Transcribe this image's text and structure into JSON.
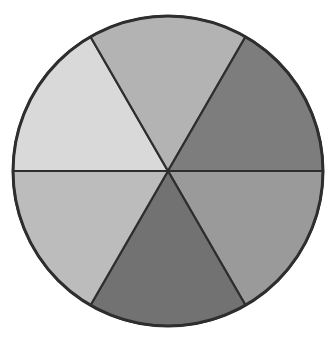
{
  "diagram": {
    "type": "segmented-circle",
    "segments_count": 6,
    "center": [
      168,
      171
    ],
    "radius": 155,
    "outline_color": "#2e2e2e",
    "segments": [
      {
        "name": "segment-upper-left",
        "start_deg": 180,
        "end_deg": 240,
        "color": "#d9d9d9"
      },
      {
        "name": "segment-top",
        "start_deg": 240,
        "end_deg": 300,
        "color": "#b3b3b3"
      },
      {
        "name": "segment-upper-right",
        "start_deg": 300,
        "end_deg": 360,
        "color": "#7d7d7d"
      },
      {
        "name": "segment-lower-right",
        "start_deg": 0,
        "end_deg": 60,
        "color": "#9a9a9a"
      },
      {
        "name": "segment-bottom",
        "start_deg": 60,
        "end_deg": 120,
        "color": "#727272"
      },
      {
        "name": "segment-lower-left",
        "start_deg": 120,
        "end_deg": 180,
        "color": "#bcbcbc"
      }
    ]
  }
}
